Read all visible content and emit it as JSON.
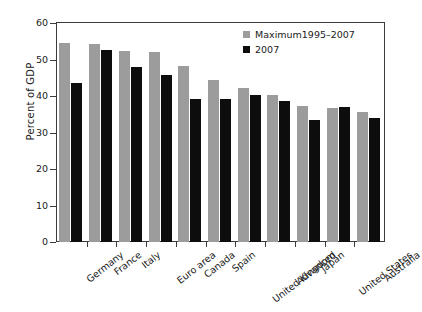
{
  "chart_data": {
    "type": "bar",
    "title": "",
    "subtitle": "",
    "xlabel": "",
    "ylabel": "Percent of GDP",
    "ylim": [
      0,
      60
    ],
    "yticks": [
      0,
      10,
      20,
      30,
      40,
      50,
      60
    ],
    "grid": false,
    "legend_position": "top-right",
    "categories": [
      "Germany",
      "France",
      "Italy",
      "Euro area",
      "Canada",
      "Spain",
      "United Kingdom",
      "Advanced",
      "Japan",
      "United States",
      "Australia"
    ],
    "series": [
      {
        "name": "Maximum1995–2007",
        "color": "#9c9c9c",
        "values": [
          54.6,
          54.3,
          52.4,
          52.0,
          48.2,
          44.4,
          42.2,
          40.2,
          37.4,
          36.8,
          35.6
        ]
      },
      {
        "name": "2007",
        "color": "#0d0d0d",
        "values": [
          43.5,
          52.5,
          47.9,
          45.8,
          39.2,
          39.3,
          40.4,
          38.7,
          33.5,
          36.9,
          34.1
        ]
      }
    ]
  },
  "legend": {
    "items": [
      {
        "label": "Maximum1995–2007",
        "swatch": "max"
      },
      {
        "label": "2007",
        "swatch": "cur"
      }
    ]
  },
  "axis": {
    "y_title": "Percent of GDP"
  }
}
